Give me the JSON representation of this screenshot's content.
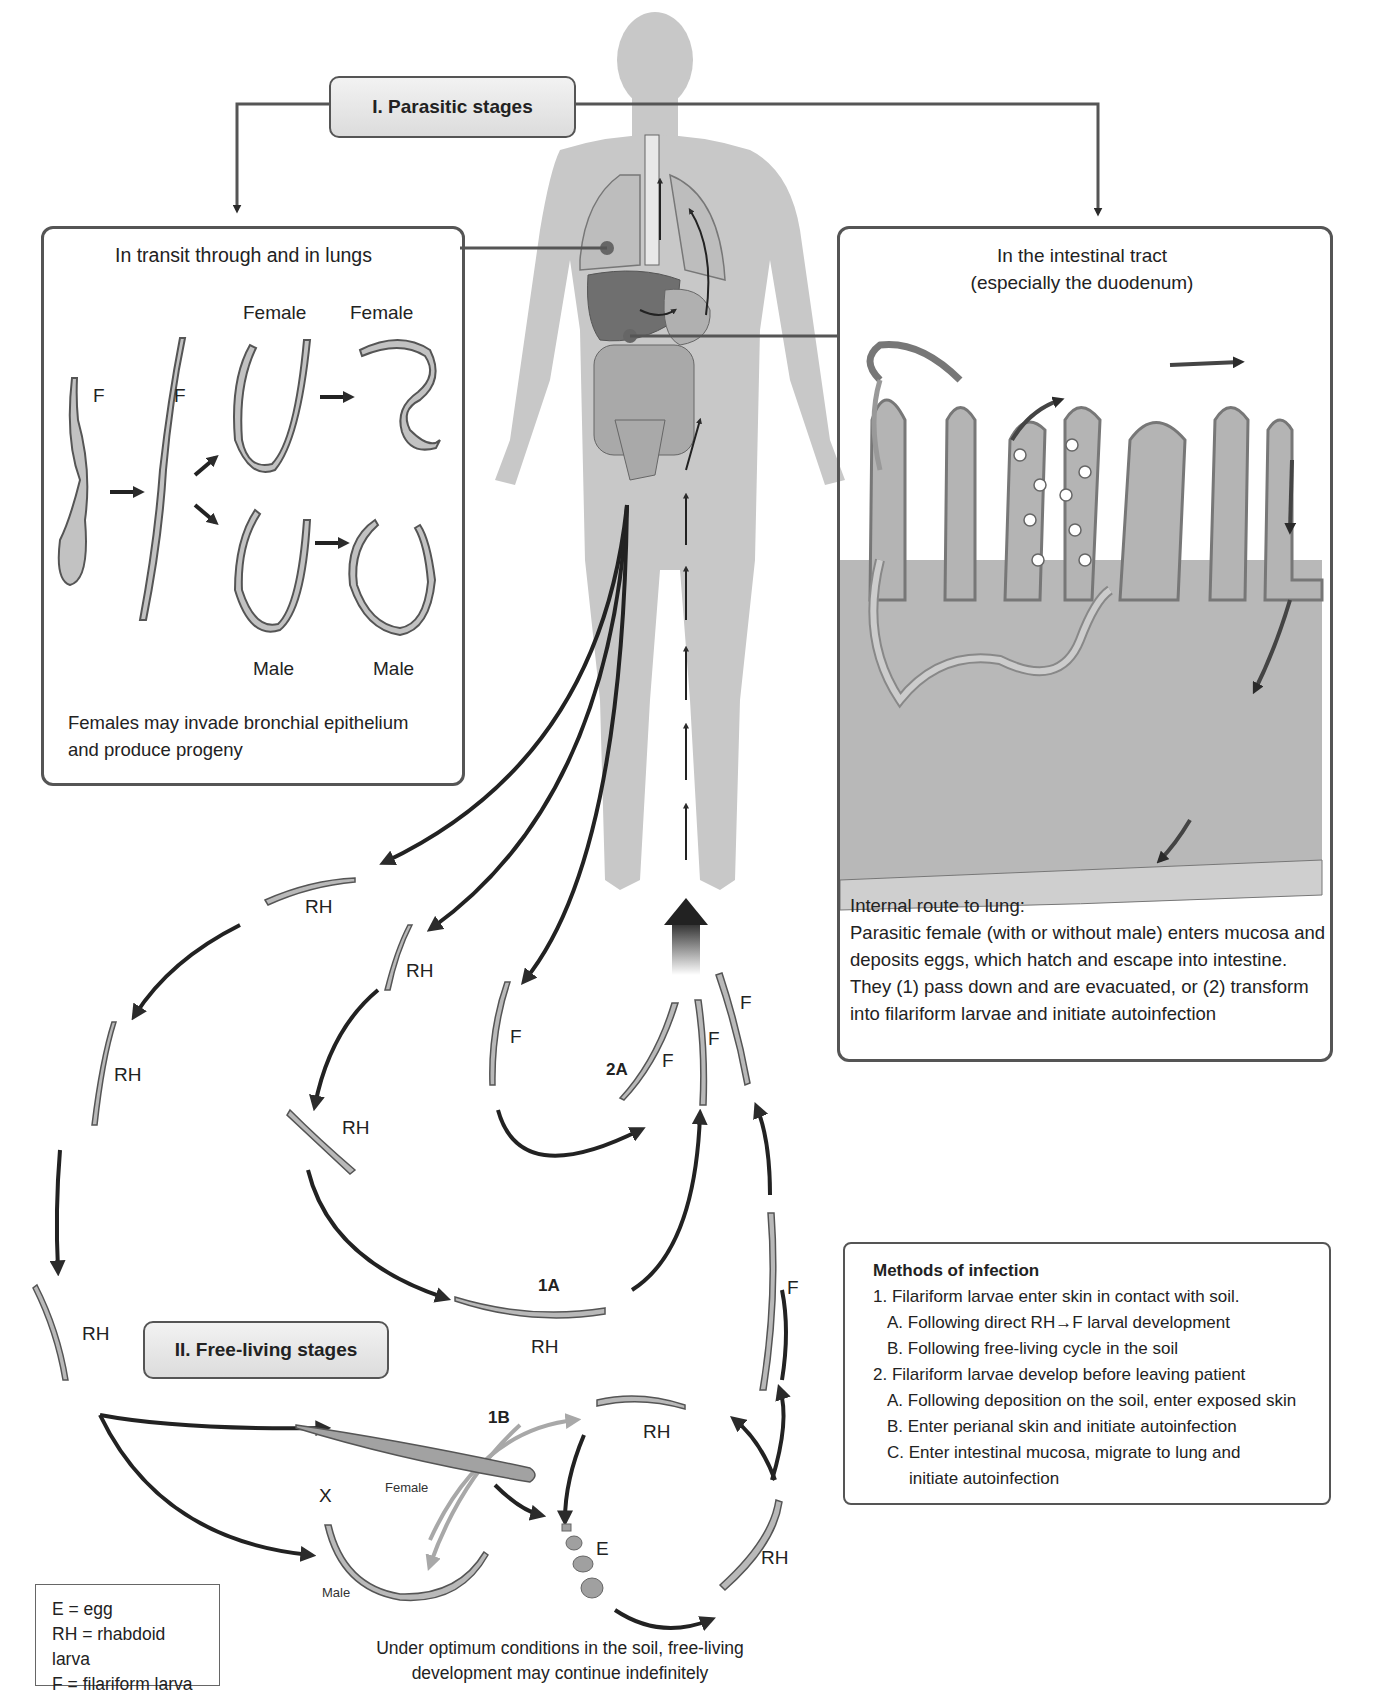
{
  "diagram": {
    "stages": {
      "parasitic": "I. Parasitic stages",
      "free_living": "II. Free-living stages"
    },
    "lung_panel": {
      "title": "In transit through and in lungs",
      "labels": {
        "f1": "F",
        "f2": "F",
        "female1": "Female",
        "female2": "Female",
        "male1": "Male",
        "male2": "Male"
      },
      "caption_line1": "Females may invade bronchial  epithelium",
      "caption_line2": "and produce progeny"
    },
    "intestine_panel": {
      "title_line1": "In the intestinal tract",
      "title_line2": "(especially the duodenum)",
      "caption": [
        "Internal route to lung:",
        "Parasitic female (with or without male) enters mucosa and",
        "deposits eggs, which hatch and escape into intestine.",
        "They (1) pass down and are evacuated,  or (2) transform",
        "into filariform larvae and initiate autoinfection"
      ]
    },
    "cycle_labels": {
      "rh1": "RH",
      "rh2": "RH",
      "rh3": "RH",
      "rh4": "RH",
      "rh5": "RH",
      "rh_1a": "RH",
      "rh_top": "RH",
      "rh_right": "RH",
      "f_left": "F",
      "f_2a": "F",
      "f_mid": "F",
      "f_right": "F",
      "f_low": "F",
      "route_1a": "1A",
      "route_1b": "1B",
      "route_2a": "2A",
      "x": "X",
      "female": "Female",
      "male": "Male",
      "egg": "E"
    },
    "methods": {
      "title": "Methods of infection",
      "items": [
        {
          "text": "1. Filariform larvae enter skin in contact with soil.",
          "level": 0
        },
        {
          "text": "A. Following direct RH→F larval development",
          "level": 1
        },
        {
          "text": "B. Following free-living cycle in the soil",
          "level": 1
        },
        {
          "text": "2. Filariform larvae develop before leaving patient",
          "level": 0
        },
        {
          "text": "A. Following deposition on the soil, enter exposed skin",
          "level": 1
        },
        {
          "text": "B. Enter perianal skin and initiate autoinfection",
          "level": 1
        },
        {
          "text": "C. Enter intestinal mucosa, migrate to lung and",
          "level": 1
        },
        {
          "text": "initiate autoinfection",
          "level": 2
        }
      ]
    },
    "legend": {
      "items": [
        "E = egg",
        "RH = rhabdoid larva",
        "F = filariform larva"
      ]
    },
    "footer_line1": "Under optimum conditions in the soil, free-living",
    "footer_line2": "development may continue indefinitely",
    "colors": {
      "body_silhouette": "#c8c8c8",
      "organ": "#a9a9a9",
      "liver": "#6f6f6f",
      "arrow": "#2b2b2b",
      "gray_arrow": "#a8a8a8",
      "panel_border": "#555555",
      "tissue": "#b4b4b4"
    }
  }
}
